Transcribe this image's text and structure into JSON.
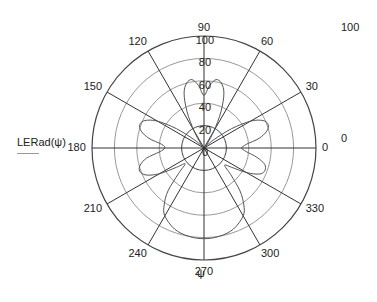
{
  "chart_data": {
    "type": "polar-line",
    "title": "",
    "xlabel": "ψ",
    "ylabel": "LERad(ψ)",
    "legend": [
      "LERad(ψ)"
    ],
    "r_range": [
      0,
      100
    ],
    "r_ticks": [
      20,
      40,
      60,
      80,
      100
    ],
    "r_tick_labels": [
      "0",
      "20",
      "40",
      "60",
      "80",
      "100"
    ],
    "angle_ticks_deg": [
      0,
      30,
      60,
      90,
      120,
      150,
      180,
      210,
      240,
      270,
      300,
      330
    ],
    "angle_tick_labels": [
      "0",
      "30",
      "60",
      "90",
      "120",
      "150",
      "180",
      "210",
      "240",
      "270",
      "300",
      "330"
    ],
    "outer_axis_labels": {
      "top_right": "100",
      "right": "0"
    },
    "grid": true,
    "series": [
      {
        "name": "LERad(ψ)",
        "color": "#555555",
        "points_deg_r": [
          [
            0,
            33
          ],
          [
            5,
            38
          ],
          [
            10,
            50
          ],
          [
            15,
            58
          ],
          [
            20,
            61
          ],
          [
            25,
            58
          ],
          [
            30,
            48
          ],
          [
            35,
            30
          ],
          [
            40,
            12
          ],
          [
            45,
            3
          ],
          [
            50,
            2
          ],
          [
            55,
            6
          ],
          [
            60,
            18
          ],
          [
            65,
            36
          ],
          [
            70,
            52
          ],
          [
            75,
            60
          ],
          [
            80,
            62
          ],
          [
            85,
            56
          ],
          [
            90,
            47
          ],
          [
            95,
            56
          ],
          [
            100,
            62
          ],
          [
            105,
            60
          ],
          [
            110,
            52
          ],
          [
            115,
            36
          ],
          [
            120,
            18
          ],
          [
            125,
            6
          ],
          [
            130,
            2
          ],
          [
            135,
            3
          ],
          [
            140,
            12
          ],
          [
            145,
            30
          ],
          [
            150,
            48
          ],
          [
            155,
            58
          ],
          [
            160,
            61
          ],
          [
            165,
            58
          ],
          [
            170,
            50
          ],
          [
            175,
            38
          ],
          [
            180,
            35
          ],
          [
            185,
            40
          ],
          [
            190,
            52
          ],
          [
            195,
            59
          ],
          [
            200,
            61
          ],
          [
            205,
            57
          ],
          [
            210,
            46
          ],
          [
            215,
            30
          ],
          [
            220,
            22
          ],
          [
            225,
            32
          ],
          [
            230,
            50
          ],
          [
            235,
            62
          ],
          [
            240,
            70
          ],
          [
            250,
            77
          ],
          [
            260,
            80
          ],
          [
            270,
            81
          ],
          [
            280,
            80
          ],
          [
            290,
            77
          ],
          [
            300,
            70
          ],
          [
            305,
            62
          ],
          [
            310,
            50
          ],
          [
            315,
            34
          ],
          [
            320,
            24
          ],
          [
            325,
            30
          ],
          [
            330,
            44
          ],
          [
            335,
            55
          ],
          [
            340,
            58
          ],
          [
            345,
            56
          ],
          [
            350,
            48
          ],
          [
            355,
            38
          ],
          [
            360,
            33
          ]
        ]
      }
    ]
  },
  "legend": {
    "label": "LERad(ψ)"
  },
  "axis": {
    "angle_label": "ψ",
    "top_right_value": "100",
    "right_value": "0"
  }
}
